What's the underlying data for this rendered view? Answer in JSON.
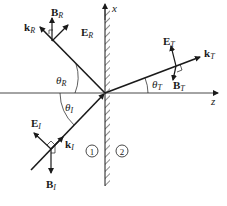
{
  "diagram": {
    "type": "electromagnetic wave reflection and transmission at interface",
    "colors": {
      "line": "#1a1a1a",
      "background": "#ffffff"
    },
    "axes": {
      "x_label": "x",
      "z_label": "z"
    },
    "regions": {
      "medium1": "1",
      "medium2": "2"
    },
    "incident": {
      "k": "k",
      "k_sub": "I",
      "E": "E",
      "E_sub": "I",
      "B": "B",
      "B_sub": "I",
      "theta": "θ",
      "theta_sub": "I"
    },
    "reflected": {
      "k": "k",
      "k_sub": "R",
      "E": "E",
      "E_sub": "R",
      "B": "B",
      "B_sub": "R",
      "theta": "θ",
      "theta_sub": "R"
    },
    "transmitted": {
      "k": "k",
      "k_sub": "T",
      "E": "E",
      "E_sub": "T",
      "B": "B",
      "B_sub": "T",
      "theta": "θ",
      "theta_sub": "T"
    }
  }
}
